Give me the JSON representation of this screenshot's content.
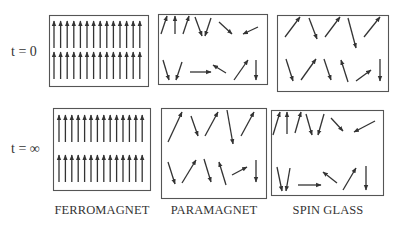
{
  "rows": [
    {
      "label": "t = 0"
    },
    {
      "label": "t = ∞"
    }
  ],
  "columns": [
    {
      "label": "FERROMAGNET"
    },
    {
      "label": "PARAMAGNET"
    },
    {
      "label": "SPIN GLASS"
    }
  ],
  "colors": {
    "line": "#333333",
    "frame": "#555555",
    "background": "#ffffff"
  },
  "panels": {
    "ferro_t0": {
      "box": [
        49,
        15,
        99,
        71
      ],
      "grid": {
        "cols": 14,
        "rows": 2,
        "x0": 54,
        "dx": 6.6,
        "rowsY": [
          [
            21,
            48
          ],
          [
            52,
            79
          ]
        ]
      }
    },
    "ferro_tinf": {
      "box": [
        53,
        108,
        97,
        82
      ],
      "grid": {
        "cols": 14,
        "rows": 2,
        "x0": 59,
        "dx": 6.4,
        "rowsY": [
          [
            115,
            142
          ],
          [
            155,
            182
          ]
        ]
      }
    },
    "para_t0": {
      "box": [
        158,
        14,
        109,
        70
      ],
      "arrows": [
        [
          161,
          34,
          167,
          16
        ],
        [
          175,
          34,
          175,
          16
        ],
        [
          183,
          34,
          189,
          16
        ],
        [
          195,
          17,
          202,
          36
        ],
        [
          211,
          18,
          205,
          36
        ],
        [
          219,
          22,
          232,
          34
        ],
        [
          258,
          27,
          243,
          34
        ],
        [
          163,
          60,
          169,
          80
        ],
        [
          182,
          62,
          176,
          80
        ],
        [
          190,
          72,
          211,
          72
        ],
        [
          226,
          73,
          213,
          65
        ],
        [
          234,
          80,
          248,
          60
        ],
        [
          256,
          60,
          256,
          80
        ]
      ]
    },
    "para_tinf": {
      "box": [
        161,
        108,
        105,
        90
      ],
      "arrows": [
        [
          168,
          142,
          182,
          112
        ],
        [
          191,
          116,
          198,
          136
        ],
        [
          205,
          136,
          218,
          112
        ],
        [
          227,
          110,
          233,
          144
        ],
        [
          241,
          136,
          254,
          112
        ],
        [
          168,
          162,
          175,
          184
        ],
        [
          182,
          183,
          196,
          160
        ],
        [
          204,
          159,
          211,
          182
        ],
        [
          226,
          185,
          219,
          162
        ],
        [
          232,
          175,
          247,
          167
        ],
        [
          256,
          160,
          256,
          182
        ]
      ]
    },
    "sg_t0": {
      "box": [
        277,
        15,
        111,
        76
      ],
      "arrows": [
        [
          285,
          37,
          300,
          17
        ],
        [
          309,
          18,
          317,
          39
        ],
        [
          325,
          37,
          340,
          17
        ],
        [
          348,
          18,
          356,
          48
        ],
        [
          364,
          37,
          380,
          17
        ],
        [
          286,
          59,
          293,
          81
        ],
        [
          301,
          80,
          316,
          59
        ],
        [
          324,
          59,
          331,
          80
        ],
        [
          348,
          82,
          341,
          60
        ],
        [
          356,
          81,
          371,
          70
        ],
        [
          380,
          59,
          380,
          81
        ]
      ]
    },
    "sg_tinf": {
      "box": [
        271,
        110,
        112,
        85
      ],
      "arrows": [
        [
          273,
          135,
          280,
          112
        ],
        [
          287,
          134,
          287,
          112
        ],
        [
          295,
          133,
          301,
          112
        ],
        [
          306,
          114,
          312,
          135
        ],
        [
          324,
          114,
          318,
          135
        ],
        [
          331,
          118,
          343,
          131
        ],
        [
          375,
          121,
          354,
          132
        ],
        [
          277,
          167,
          282,
          191
        ],
        [
          290,
          168,
          286,
          191
        ],
        [
          298,
          185,
          321,
          185
        ],
        [
          337,
          183,
          323,
          172
        ],
        [
          343,
          190,
          356,
          168
        ],
        [
          366,
          166,
          366,
          190
        ]
      ]
    }
  }
}
